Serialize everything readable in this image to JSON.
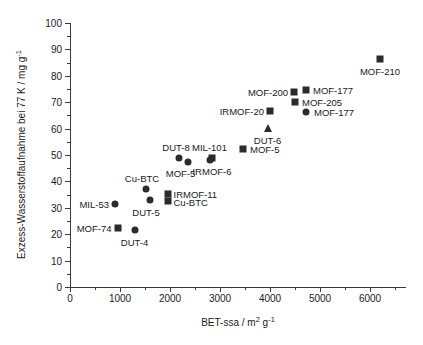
{
  "chart_data": {
    "type": "scatter",
    "title": "",
    "xlabel": "BET-ssa / m2 g-1",
    "ylabel": "Exzess-Wasserstoffaufnahme bei 77 K / mg g-1",
    "xlim": [
      0,
      6720
    ],
    "ylim": [
      0,
      100
    ],
    "xticks": [
      0,
      1000,
      2000,
      3000,
      4000,
      5000,
      6000
    ],
    "xtick_labels": [
      "0",
      "1000",
      "2000",
      "3000",
      "4000",
      "5000",
      "6000"
    ],
    "xtick_minor_step": 500,
    "yticks": [
      0,
      10,
      20,
      30,
      40,
      50,
      60,
      70,
      80,
      90,
      100
    ],
    "ytick_labels": [
      "0",
      "10",
      "20",
      "30",
      "40",
      "50",
      "60",
      "70",
      "80",
      "90",
      "100"
    ],
    "ytick_minor_step": 5,
    "grid": false,
    "legend": "none",
    "marker_color": "#2b2b2b",
    "axis_color": "#3a3a3a",
    "points": [
      {
        "name": "MIL-53",
        "x": 900,
        "y": 31.5,
        "marker": "circle",
        "label": "MIL-53",
        "label_pos": "left",
        "label_dx": -6,
        "label_dy": 0
      },
      {
        "name": "MOF-74",
        "x": 950,
        "y": 22.5,
        "marker": "square",
        "label": "MOF-74",
        "label_pos": "left",
        "label_dx": -6,
        "label_dy": 0
      },
      {
        "name": "DUT-4",
        "x": 1290,
        "y": 21.5,
        "marker": "circle",
        "label": "DUT-4",
        "label_pos": "below",
        "label_dx": 0,
        "label_dy": 12
      },
      {
        "name": "Cu-BTC-c",
        "x": 1520,
        "y": 37.3,
        "marker": "circle",
        "label": "Cu-BTC",
        "label_pos": "above",
        "label_dx": -4,
        "label_dy": -11
      },
      {
        "name": "DUT-5",
        "x": 1600,
        "y": 33.0,
        "marker": "circle",
        "label": "DUT-5",
        "label_pos": "below",
        "label_dx": -4,
        "label_dy": 12
      },
      {
        "name": "IRMOF-11",
        "x": 1950,
        "y": 35.3,
        "marker": "square",
        "label": "IRMOF-11",
        "label_pos": "right",
        "label_dx": 6,
        "label_dy": 0
      },
      {
        "name": "Cu-BTC-s",
        "x": 1950,
        "y": 32.6,
        "marker": "square",
        "label": "Cu-BTC",
        "label_pos": "right",
        "label_dx": 6,
        "label_dy": 1
      },
      {
        "name": "DUT-8",
        "x": 2180,
        "y": 49.0,
        "marker": "circle",
        "label": "DUT-8",
        "label_pos": "above",
        "label_dx": -3,
        "label_dy": -11
      },
      {
        "name": "MOF-5-c",
        "x": 2350,
        "y": 47.2,
        "marker": "circle",
        "label": "MOF-5",
        "label_pos": "below",
        "label_dx": -7,
        "label_dy": 11
      },
      {
        "name": "IRMOF-6",
        "x": 2800,
        "y": 48.2,
        "marker": "circle",
        "label": "IRMOF-6",
        "label_pos": "below",
        "label_dx": 2,
        "label_dy": 11
      },
      {
        "name": "MIL-101",
        "x": 2830,
        "y": 48.8,
        "marker": "square",
        "label": "MIL-101",
        "label_pos": "above",
        "label_dx": -2,
        "label_dy": -11
      },
      {
        "name": "MOF-5-s",
        "x": 3460,
        "y": 52.2,
        "marker": "square",
        "label": "MOF-5",
        "label_pos": "right",
        "label_dx": 7,
        "label_dy": 0
      },
      {
        "name": "DUT-6",
        "x": 3950,
        "y": 60.3,
        "marker": "triangle",
        "label": "DUT-6",
        "label_pos": "below",
        "label_dx": 0,
        "label_dy": 12
      },
      {
        "name": "IRMOF-20",
        "x": 4000,
        "y": 66.5,
        "marker": "square",
        "label": "IRMOF-20",
        "label_pos": "left",
        "label_dx": -6,
        "label_dy": 0
      },
      {
        "name": "MOF-200",
        "x": 4480,
        "y": 74.0,
        "marker": "square",
        "label": "MOF-200",
        "label_pos": "left",
        "label_dx": -6,
        "label_dy": 0
      },
      {
        "name": "MOF-205",
        "x": 4500,
        "y": 70.2,
        "marker": "square",
        "label": "MOF-205",
        "label_pos": "right",
        "label_dx": 7,
        "label_dy": 0
      },
      {
        "name": "MOF-177-s",
        "x": 4720,
        "y": 74.5,
        "marker": "square",
        "label": "MOF-177",
        "label_pos": "right",
        "label_dx": 7,
        "label_dy": 0
      },
      {
        "name": "MOF-177-c",
        "x": 4720,
        "y": 66.3,
        "marker": "circle",
        "label": "MOF-177",
        "label_pos": "right",
        "label_dx": 8,
        "label_dy": 0
      },
      {
        "name": "MOF-210",
        "x": 6200,
        "y": 86.4,
        "marker": "square",
        "label": "MOF-210",
        "label_pos": "below",
        "label_dx": 0,
        "label_dy": 12
      }
    ]
  },
  "axis_titles": {
    "x_prefix": "BET-ssa / m",
    "x_sup1": "2",
    "x_mid": " g",
    "x_sup2": "-1",
    "y_prefix": "Exzess-Wasserstoffaufnahme bei 77 K / mg g",
    "y_sup": "-1"
  }
}
